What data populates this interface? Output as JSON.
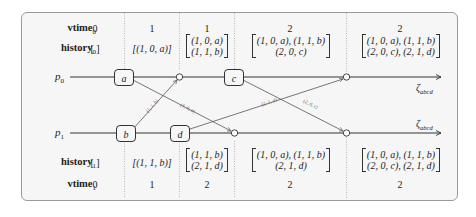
{
  "diagram": {
    "labels": {
      "vtime0": "vtime",
      "vtime0_sub": "0",
      "history0": "history",
      "history0_sub": "0",
      "history1": "history",
      "history1_sub": "1",
      "vtime1": "vtime",
      "vtime1_sub": "1"
    },
    "processes": {
      "p0": "p",
      "p0_sub": "0",
      "p1": "p",
      "p1_sub": "1",
      "end0": "ζ",
      "end0_sub": "abcd",
      "end1": "ζ",
      "end1_sub": "abcd"
    },
    "events": {
      "a": "a",
      "b": "b",
      "c": "c",
      "d": "d"
    },
    "messages": {
      "a_to_p1": "(1, 0, a)",
      "b_to_p0": "(1, 1, b)",
      "c_to_p1": "(2, 0, c)",
      "d_to_p0": "(2, 1, d)"
    },
    "top": {
      "vtime": [
        "0",
        "1",
        "1",
        "2",
        "2"
      ],
      "history": [
        [
          "[ ]"
        ],
        [
          "[(1, 0, a)]"
        ],
        [
          "(1, 0, a)",
          "(1, 1, b)"
        ],
        [
          "(1, 0, a), (1, 1, b)",
          "(2, 0, c)"
        ],
        [
          "(1, 0, a), (1, 1, b)",
          "(2, 0, c), (2, 1, d)"
        ]
      ]
    },
    "bottom": {
      "history": [
        [
          "[ ]"
        ],
        [
          "[(1, 1, b)]"
        ],
        [
          "(1, 1, b)",
          "(2, 1, d)"
        ],
        [
          "(1, 0, a), (1, 1, b)",
          "(2, 1, d)"
        ],
        [
          "(1, 0, a), (1, 1, b)",
          "(2, 0, c), (2, 1, d)"
        ]
      ],
      "vtime": [
        "0",
        "1",
        "2",
        "2",
        "2"
      ]
    }
  }
}
